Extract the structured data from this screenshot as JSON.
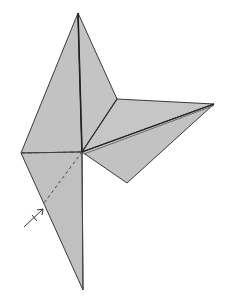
{
  "diagram": {
    "type": "origami-fold-step",
    "colors": {
      "paper_fill": "#c2c2c2",
      "edge": "#3a3a3a",
      "crease": "#222222",
      "dashed": "#444444",
      "background": "#ffffff"
    },
    "vertices": {
      "top": [
        78,
        13
      ],
      "left": [
        21,
        153
      ],
      "center": [
        82,
        152
      ],
      "notch": [
        117,
        99
      ],
      "right": [
        214,
        104
      ],
      "lower_right": [
        127,
        183
      ],
      "bottom": [
        83,
        290
      ],
      "left_edge_mark": [
        44,
        203
      ]
    },
    "arrow": {
      "from": [
        24,
        227
      ],
      "to": [
        44,
        208
      ],
      "symbol": "valley-fold-arrow"
    }
  }
}
